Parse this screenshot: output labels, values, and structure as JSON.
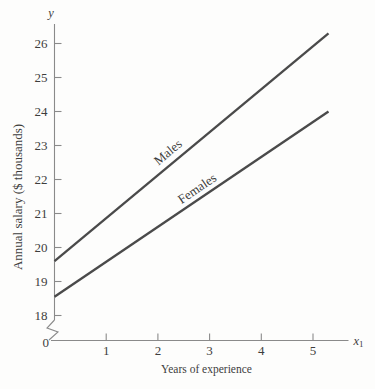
{
  "figure": {
    "background": "#fdfdfc"
  },
  "chart_data": {
    "type": "line",
    "title": "",
    "xlabel": "Years of experience",
    "ylabel": "Annual salary ($ thousands)",
    "x_axis_symbol": "x",
    "x_axis_symbol_subscript": "1",
    "y_axis_symbol": "y",
    "origin_label": "0",
    "axis_break_on_y": true,
    "grid": false,
    "legend_position": "inline-rotated-labels",
    "x_ticks": [
      1,
      2,
      3,
      4,
      5
    ],
    "y_ticks": [
      18,
      19,
      20,
      21,
      22,
      23,
      24,
      25,
      26
    ],
    "xlim": [
      0,
      5.7
    ],
    "ylim": [
      18,
      26.6
    ],
    "series": [
      {
        "name": "Males",
        "points": [
          {
            "x": 0,
            "y": 19.6
          },
          {
            "x": 5.3,
            "y": 26.3
          }
        ]
      },
      {
        "name": "Females",
        "points": [
          {
            "x": 0,
            "y": 18.55
          },
          {
            "x": 5.3,
            "y": 24.0
          }
        ]
      }
    ],
    "colors": {
      "line": "#4a4a4a",
      "axis": "#8a8a8a",
      "text": "#3d3d3d"
    }
  }
}
